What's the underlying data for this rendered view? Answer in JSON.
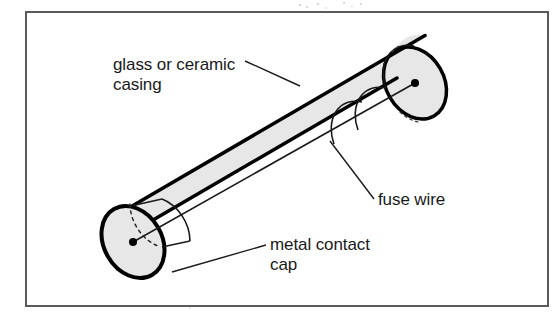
{
  "figure": {
    "background_color": "#ffffff",
    "frame": {
      "name": "figure-border",
      "color": "#5a5a5a",
      "x": 26,
      "y": 12,
      "width": 522,
      "height": 294
    },
    "body": {
      "name": "glass-ceramic-casing",
      "fill_color": "#e7e7e7",
      "outline_color": "#000000",
      "outline_width": 3.5
    },
    "caps": {
      "name": "metal-contact-cap",
      "fill_color": "#e7e7e7",
      "band_color": "#1a1a1a"
    },
    "wire": {
      "name": "fuse-wire",
      "color": "#1a1a1a",
      "width": 1.6,
      "terminal_dot_color": "#000000"
    },
    "hidden_edge_style": "dashed",
    "labels": [
      {
        "id": "casing",
        "name": "label-glass-or-ceramic-casing",
        "lines": [
          "glass or ceramic",
          "casing"
        ],
        "line1": "glass or ceramic",
        "line2": "casing",
        "x": 113,
        "y": 70,
        "leader": "from text right edge down-right to cylinder top surface"
      },
      {
        "id": "wire",
        "name": "label-fuse-wire",
        "lines": [
          "fuse wire"
        ],
        "line1": "fuse wire",
        "x": 378,
        "y": 205,
        "leader": "from text left edge up-left to fuse wire midpoint"
      },
      {
        "id": "cap",
        "name": "label-metal-contact-cap",
        "lines": [
          "metal contact",
          "cap"
        ],
        "line1": "metal contact",
        "line2": "cap",
        "x": 270,
        "y": 250,
        "leader": "from text left edge down-left to lower cap rim"
      }
    ]
  }
}
